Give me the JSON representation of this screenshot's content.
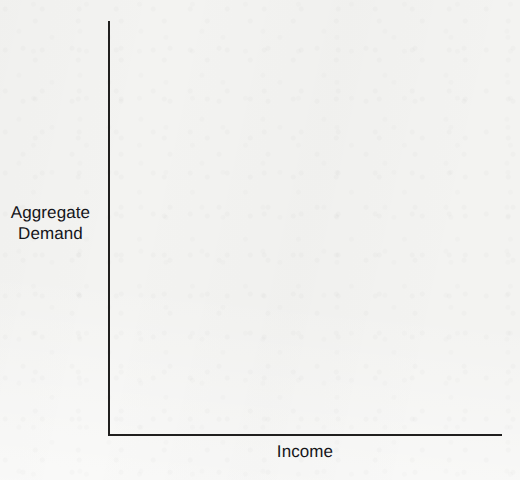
{
  "figure": {
    "background_color": "#f3f3f1",
    "ink_color": "#201f1e",
    "text_color": "#15151a",
    "width": 520,
    "height": 480
  },
  "axes": {
    "y_axis_label_line1": "Aggregate",
    "y_axis_label_line2": "Demand",
    "x_axis_label": "Income"
  },
  "chart_data": {
    "type": "line",
    "title": "",
    "subtitle": "",
    "xlabel": "Income",
    "ylabel": "Aggregate Demand",
    "xlim": [
      0,
      1
    ],
    "ylim": [
      0,
      1
    ],
    "grid": false,
    "x_ticks": [],
    "y_ticks": [],
    "x_tick_labels": [],
    "y_tick_labels": [],
    "legend": [],
    "legend_position": "none",
    "annotations": [],
    "series": []
  }
}
